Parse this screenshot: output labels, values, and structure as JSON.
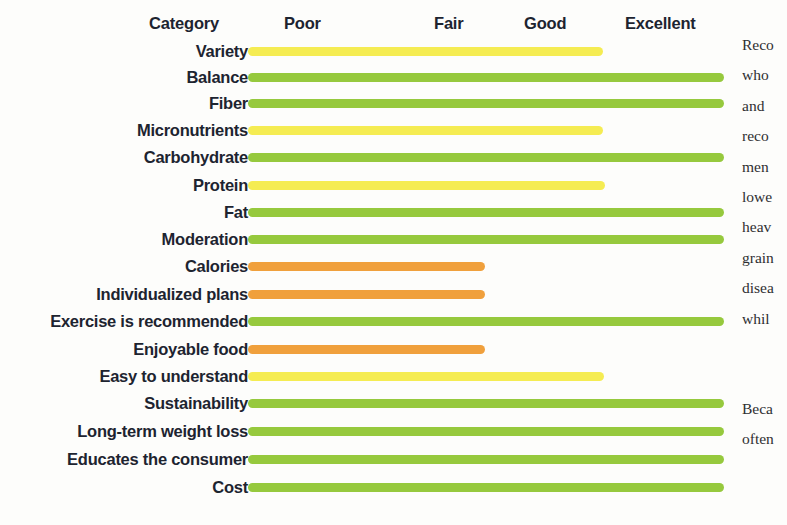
{
  "chart_data": {
    "type": "bar",
    "title": "",
    "orientation": "horizontal",
    "xlabel": "",
    "ylabel": "Category",
    "scale_labels": [
      "Poor",
      "Fair",
      "Good",
      "Excellent"
    ],
    "scale_values": [
      1,
      2,
      3,
      4
    ],
    "rating_colors": {
      "fair": "#f5ec52",
      "good": "#f5ec52",
      "excellent": "#96c93d",
      "poor": "#f0a03c"
    },
    "categories": [
      "Variety",
      "Balance",
      "Fiber",
      "Micronutrients",
      "Carbohydrate",
      "Protein",
      "Fat",
      "Moderation",
      "Calories",
      "Individualized plans",
      "Exercise is recommended",
      "Enjoyable food",
      "Easy to understand",
      "Sustainability",
      "Long-term weight loss",
      "Educates the consumer",
      "Cost"
    ],
    "ratings": [
      "Good",
      "Excellent",
      "Excellent",
      "Good",
      "Excellent",
      "Good",
      "Excellent",
      "Excellent",
      "Fair",
      "Fair",
      "Excellent",
      "Fair",
      "Good",
      "Excellent",
      "Excellent",
      "Excellent",
      "Excellent"
    ],
    "values": [
      3,
      4,
      4,
      3,
      4,
      3,
      4,
      4,
      2,
      2,
      4,
      2,
      3,
      4,
      4,
      4,
      4
    ],
    "colors": [
      "#f5ec52",
      "#96c93d",
      "#96c93d",
      "#f5ec52",
      "#96c93d",
      "#f5ec52",
      "#96c93d",
      "#96c93d",
      "#f0a03c",
      "#f0a03c",
      "#96c93d",
      "#f0a03c",
      "#f5ec52",
      "#96c93d",
      "#96c93d",
      "#96c93d",
      "#96c93d"
    ],
    "grid": false,
    "legend": "none"
  },
  "header": {
    "category_label": "Category",
    "ticks": [
      {
        "label": "Poor",
        "left": 284
      },
      {
        "label": "Fair",
        "left": 434
      },
      {
        "label": "Good",
        "left": 524
      },
      {
        "label": "Excellent",
        "left": 625
      }
    ]
  },
  "rows": [
    {
      "label": "Variety",
      "top": 38,
      "width": 355,
      "color": "#f5ec52"
    },
    {
      "label": "Balance",
      "top": 64,
      "width": 476,
      "color": "#96c93d"
    },
    {
      "label": "Fiber",
      "top": 90,
      "width": 476,
      "color": "#96c93d"
    },
    {
      "label": "Micronutrients",
      "top": 117,
      "width": 355,
      "color": "#f5ec52"
    },
    {
      "label": "Carbohydrate",
      "top": 144,
      "width": 476,
      "color": "#96c93d"
    },
    {
      "label": "Protein",
      "top": 172,
      "width": 357,
      "color": "#f5ec52"
    },
    {
      "label": "Fat",
      "top": 199,
      "width": 476,
      "color": "#96c93d"
    },
    {
      "label": "Moderation",
      "top": 226,
      "width": 476,
      "color": "#96c93d"
    },
    {
      "label": "Calories",
      "top": 253,
      "width": 237,
      "color": "#f0a03c"
    },
    {
      "label": "Individualized plans",
      "top": 281,
      "width": 237,
      "color": "#f0a03c"
    },
    {
      "label": "Exercise is recommended",
      "top": 308,
      "width": 476,
      "color": "#96c93d"
    },
    {
      "label": "Enjoyable food",
      "top": 336,
      "width": 237,
      "color": "#f0a03c"
    },
    {
      "label": "Easy to understand",
      "top": 363,
      "width": 356,
      "color": "#f5ec52"
    },
    {
      "label": "Sustainability",
      "top": 390,
      "width": 476,
      "color": "#96c93d"
    },
    {
      "label": "Long-term weight loss",
      "top": 418,
      "width": 476,
      "color": "#96c93d"
    },
    {
      "label": "Educates the consumer",
      "top": 446,
      "width": 476,
      "color": "#96c93d"
    },
    {
      "label": "Cost",
      "top": 474,
      "width": 476,
      "color": "#96c93d"
    }
  ],
  "side_text": {
    "block1": [
      "Reco",
      "who",
      "and",
      "reco",
      "men",
      "lowe",
      "heav",
      "grain",
      "disea",
      "whil"
    ],
    "block2": [
      "Beca",
      "often"
    ]
  }
}
